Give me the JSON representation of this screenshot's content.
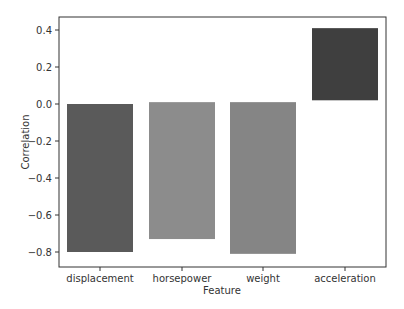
{
  "chart_data": {
    "type": "bar",
    "title": "",
    "xlabel": "Feature",
    "ylabel": "Correlation",
    "categories": [
      "displacement",
      "horsepower",
      "weight",
      "acceleration"
    ],
    "values": [
      -0.8,
      -0.73,
      -0.81,
      0.41
    ],
    "bar_bottoms": [
      0.0,
      0.01,
      0.01,
      0.02
    ],
    "colors": [
      "#5a5a5a",
      "#8c8c8c",
      "#858585",
      "#3f3f3f"
    ],
    "ylim": [
      -0.88,
      0.47
    ],
    "yticks": [
      0.4,
      0.2,
      0.0,
      -0.2,
      -0.4,
      -0.6,
      -0.8
    ],
    "ytick_labels": [
      "0.4",
      "0.2",
      "0.0",
      "−0.2",
      "−0.4",
      "−0.6",
      "−0.8"
    ],
    "grid": false,
    "legend": null
  }
}
